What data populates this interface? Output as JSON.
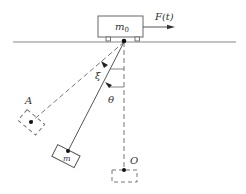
{
  "diagram": {
    "type": "physics-pendulum-on-cart",
    "labels": {
      "cart_mass": "m",
      "cart_mass_sub": "0",
      "force": "F(t)",
      "pendulum_mass": "m",
      "xi": "ξ",
      "theta": "θ",
      "point_a": "A",
      "point_o": "O"
    },
    "colors": {
      "stroke": "#555555",
      "ground": "#888888",
      "text": "#333333"
    }
  }
}
